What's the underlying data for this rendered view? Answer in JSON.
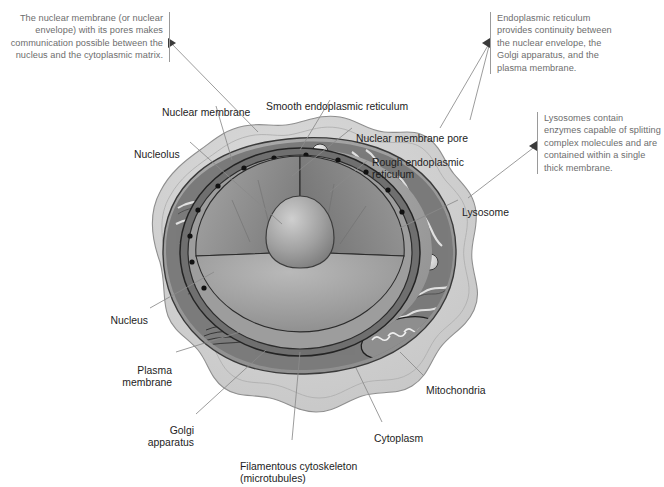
{
  "figure": {
    "background_color": "#ffffff",
    "note_text_color": "#6d6d6d",
    "label_text_color": "#1d1d1d",
    "leader_line_color": "#8a8a8a"
  },
  "notes": [
    {
      "id": "nuclear-membrane-note",
      "text": "The nuclear membrane (or nuclear envelope) with its pores makes communication possible between the nucleus and the cytoplasmic matrix.",
      "align": "right"
    },
    {
      "id": "endoplasmic-reticulum-note",
      "text": "Endoplasmic reticulum provides continuity between the nuclear envelope, the Golgi apparatus, and the plasma membrane.",
      "align": "left"
    },
    {
      "id": "lysosome-note",
      "text": "Lysosomes contain enzymes capable of splitting complex molecules and are contained within a single thick membrane.",
      "align": "left"
    }
  ],
  "labels": [
    {
      "id": "nuclear-membrane",
      "text": "Nuclear membrane"
    },
    {
      "id": "smooth-er",
      "text": "Smooth endoplasmic reticulum"
    },
    {
      "id": "nuclear-membrane-pore",
      "text": "Nuclear membrane pore"
    },
    {
      "id": "rough-er",
      "text": "Rough endoplasmic\nreticulum"
    },
    {
      "id": "nucleolus",
      "text": "Nucleolus"
    },
    {
      "id": "lysosome",
      "text": "Lysosome"
    },
    {
      "id": "nucleus",
      "text": "Nucleus"
    },
    {
      "id": "plasma-membrane",
      "text": "Plasma\nmembrane"
    },
    {
      "id": "golgi-apparatus",
      "text": "Golgi\napparatus"
    },
    {
      "id": "filamentous-cytoskeleton",
      "text": "Filamentous cytoskeleton\n(microtubules)"
    },
    {
      "id": "cytoplasm",
      "text": "Cytoplasm"
    },
    {
      "id": "mitochondria",
      "text": "Mitochondria"
    }
  ],
  "illustration_palette": {
    "plasma_membrane_fill": "#d2d2d2",
    "cytoplasm_mid": "#9a9a9a",
    "cytoplasm_dark": "#6b6b6b",
    "nucleus_fill": "#8e8e8e",
    "nucleus_light": "#b6b6b6",
    "nucleolus_fill": "#a8a8a8",
    "outline": "#2b2b2b",
    "vesicle_fill": "#e2e2e2"
  }
}
